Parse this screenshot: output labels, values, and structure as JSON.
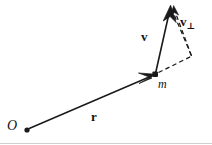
{
  "figure": {
    "kind": "vector-diagram",
    "background_color": "#ffffff",
    "stroke_color": "#1a1a1a",
    "labels": {
      "origin": "O",
      "mass": "m",
      "position_vector": "r",
      "velocity_vector": "v",
      "perpendicular_velocity": "v",
      "perpendicular_subscript": "⊥"
    },
    "points": {
      "origin": {
        "x": 27,
        "y": 130
      },
      "mass": {
        "x": 155,
        "y": 74
      },
      "velocity_tip": {
        "x": 170,
        "y": 6
      },
      "dashed_corner": {
        "x": 192,
        "y": 56
      }
    },
    "vectors": [
      {
        "name": "r",
        "label": "r",
        "from": "origin",
        "to": "mass",
        "style": "solid",
        "arrowhead": true
      },
      {
        "name": "v",
        "label": "v",
        "from": "mass",
        "to": "velocity_tip",
        "style": "solid",
        "arrowhead": true
      },
      {
        "name": "v-perp",
        "label": "v⊥",
        "from": "dashed_corner",
        "to": "velocity_tip",
        "style": "dashed",
        "arrowhead": true
      },
      {
        "name": "r-extension",
        "label": "",
        "from": "mass",
        "to": "dashed_corner",
        "style": "dashed",
        "arrowhead": false
      },
      {
        "name": "v-closure",
        "label": "",
        "from": "velocity_tip",
        "to": "dashed_corner",
        "style": "dashed",
        "arrowhead": false
      }
    ],
    "baseline_rule": {
      "visible": true,
      "y": 143,
      "color": "#cfcfcf"
    }
  }
}
